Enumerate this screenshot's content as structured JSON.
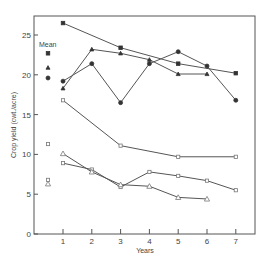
{
  "chart_data": {
    "type": "line",
    "title": "",
    "xlabel": "Years",
    "ylabel": "Crop yield (cwt./acre)",
    "xlim": [
      0,
      7.6
    ],
    "ylim": [
      0,
      27
    ],
    "x_ticks": [
      1,
      2,
      3,
      4,
      5,
      6,
      7
    ],
    "y_ticks": [
      0,
      5,
      10,
      15,
      20,
      25
    ],
    "grid": false,
    "legend_title": "Mean",
    "series": [
      {
        "name": "filled-square",
        "marker": "square",
        "filled": true,
        "x": [
          1,
          3,
          5,
          7
        ],
        "values": [
          26.5,
          23.4,
          21.4,
          20.2
        ],
        "mean": 22.7
      },
      {
        "name": "filled-triangle",
        "marker": "triangle",
        "filled": true,
        "x": [
          1,
          2,
          3,
          4,
          5,
          6
        ],
        "values": [
          18.3,
          23.2,
          22.7,
          21.9,
          20.1,
          20.1
        ],
        "mean": 20.9
      },
      {
        "name": "filled-circle",
        "marker": "circle",
        "filled": true,
        "x": [
          1,
          2,
          3,
          4,
          5,
          6,
          7
        ],
        "values": [
          19.2,
          21.4,
          16.5,
          21.4,
          22.9,
          21.1,
          16.8
        ],
        "mean": 19.6
      },
      {
        "name": "open-square-upper",
        "marker": "square",
        "filled": false,
        "x": [
          1,
          3,
          5,
          7
        ],
        "values": [
          16.8,
          11.1,
          9.7,
          9.7
        ],
        "mean": 11.3
      },
      {
        "name": "open-square-lower",
        "marker": "square",
        "filled": false,
        "x": [
          1,
          2,
          3,
          4,
          5,
          6,
          7
        ],
        "values": [
          8.9,
          8.1,
          5.9,
          7.8,
          7.3,
          6.7,
          5.5
        ],
        "mean": 6.8
      },
      {
        "name": "open-triangle",
        "marker": "triangle",
        "filled": false,
        "x": [
          1,
          2,
          3,
          4,
          5,
          6
        ],
        "values": [
          10.1,
          7.8,
          6.2,
          6.0,
          4.6,
          4.4
        ],
        "mean": 6.3
      }
    ]
  }
}
